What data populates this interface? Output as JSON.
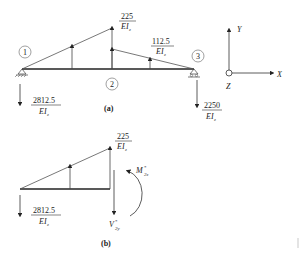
{
  "diagram_a": {
    "caption": "(a)",
    "nodes": [
      {
        "id": "1",
        "label": "1"
      },
      {
        "id": "2",
        "label": "2"
      },
      {
        "id": "3",
        "label": "3"
      }
    ],
    "loads": {
      "peak": {
        "num": "225",
        "den": "EI",
        "den_sub": "z"
      },
      "right": {
        "num": "112.5",
        "den": "EI",
        "den_sub": "z"
      }
    },
    "reactions": {
      "left": {
        "num": "2812.5",
        "den": "EI",
        "den_sub": "z"
      },
      "right": {
        "num": "2250",
        "den": "EI",
        "den_sub": "z"
      }
    }
  },
  "axes": {
    "x": "X",
    "y": "Y",
    "z": "Z"
  },
  "diagram_b": {
    "caption": "(b)",
    "loads": {
      "peak": {
        "num": "225",
        "den": "EI",
        "den_sub": "z"
      }
    },
    "reactions": {
      "left": {
        "num": "2812.5",
        "den": "EI",
        "den_sub": "z"
      }
    },
    "moment": {
      "symbol": "M",
      "sup": "*",
      "sub": "2z"
    },
    "shear": {
      "symbol": "V",
      "sup": "*",
      "sub": "2y"
    }
  }
}
